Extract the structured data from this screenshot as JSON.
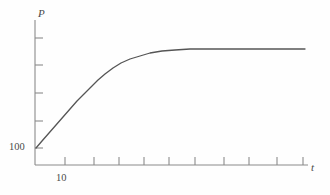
{
  "figure": {
    "background_color": "#fefefe",
    "line_color": "#555555",
    "axis_color": "#8a8a8a",
    "text_color": "#4a4a4a"
  },
  "axes": {
    "y_axis_title": "P",
    "x_axis_title": "t",
    "y_tick_label": "100",
    "x_tick_label": "10"
  },
  "chart_data": {
    "type": "line",
    "title": "",
    "subtitle": "",
    "xlabel": "t",
    "ylabel": "P",
    "xscale": "log",
    "yscale": "linear",
    "grid": false,
    "legend": false,
    "legend_position": "none",
    "annotations": [],
    "x_tick_labels": [
      "10"
    ],
    "y_tick_labels": [
      "100"
    ],
    "x_tick_count": 11,
    "y_tick_count": 5,
    "series": [
      {
        "name": "P(t)",
        "color": "#555555",
        "points": [
          {
            "x": 36,
            "y": 148
          },
          {
            "x": 42,
            "y": 141
          },
          {
            "x": 49,
            "y": 133
          },
          {
            "x": 56,
            "y": 125
          },
          {
            "x": 63,
            "y": 117
          },
          {
            "x": 70,
            "y": 109
          },
          {
            "x": 77,
            "y": 101
          },
          {
            "x": 84,
            "y": 94
          },
          {
            "x": 91,
            "y": 87
          },
          {
            "x": 98,
            "y": 80
          },
          {
            "x": 105,
            "y": 74
          },
          {
            "x": 113,
            "y": 68
          },
          {
            "x": 121,
            "y": 63
          },
          {
            "x": 130,
            "y": 59
          },
          {
            "x": 140,
            "y": 56
          },
          {
            "x": 150,
            "y": 53
          },
          {
            "x": 162,
            "y": 51
          },
          {
            "x": 175,
            "y": 50
          },
          {
            "x": 190,
            "y": 49
          },
          {
            "x": 210,
            "y": 49
          },
          {
            "x": 240,
            "y": 49
          },
          {
            "x": 270,
            "y": 49
          },
          {
            "x": 305,
            "y": 49
          }
        ]
      }
    ],
    "y_axis_range_px": [
      20,
      165
    ],
    "x_axis_range_px": [
      35,
      308
    ]
  }
}
